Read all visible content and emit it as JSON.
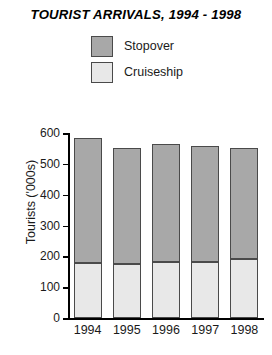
{
  "chart_data": {
    "type": "bar",
    "subtype": "stacked-bar",
    "title": "TOURIST ARRIVALS, 1994 - 1998",
    "xlabel": "",
    "ylabel": "Tourists ('000s)",
    "categories": [
      "1994",
      "1995",
      "1996",
      "1997",
      "1998"
    ],
    "series": [
      {
        "name": "Cruiseship",
        "color": "#e8e8e8",
        "values": [
          178,
          175,
          183,
          183,
          190
        ]
      },
      {
        "name": "Stopover",
        "color": "#a8a8a8",
        "values": [
          407,
          377,
          382,
          375,
          363
        ]
      }
    ],
    "totals": [
      585,
      552,
      565,
      558,
      553
    ],
    "stack_order": [
      "Cruiseship",
      "Stopover"
    ],
    "ylim": [
      0,
      600
    ],
    "ytick_values": [
      600,
      500,
      400,
      300,
      200,
      100,
      0
    ],
    "ytick_labels": [
      "600",
      "500",
      "400",
      "300",
      "200",
      "100",
      "0"
    ],
    "grid": false,
    "legend_position": "top-center",
    "legend_entries": [
      "Stopover",
      "Cruiseship"
    ],
    "axis_color": "#000000",
    "bar_border_color": "#4a4a4a",
    "background_color": "#ffffff"
  }
}
